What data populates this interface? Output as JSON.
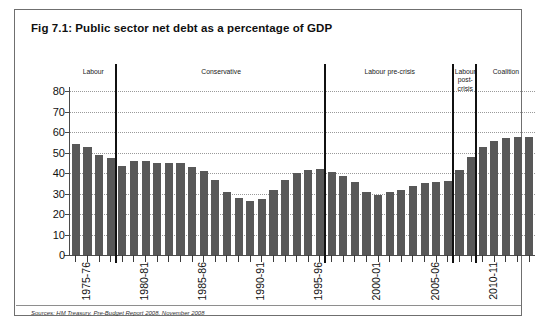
{
  "figure": {
    "title": "Fig 7.1: Public sector net debt as a percentage of GDP",
    "source": "Sources: HM Treasury, Pre-Budget Report 2008, November 2008",
    "border_color": "#6f6f6f",
    "bar_color": "#585858",
    "gridline_color": "#9a9a9a"
  },
  "periods": [
    {
      "label": "Labour",
      "start_index": 0,
      "end_index": 4
    },
    {
      "label": "Conservative",
      "start_index": 4,
      "end_index": 22
    },
    {
      "label": "Labour pre-crisis",
      "start_index": 22,
      "end_index": 33
    },
    {
      "label": "Labour post-crisis",
      "start_index": 33,
      "end_index": 35
    },
    {
      "label": "Coalition",
      "start_index": 35,
      "end_index": 40
    }
  ],
  "chart_data": {
    "type": "bar",
    "title": "Fig 7.1: Public sector net debt as a percentage of GDP",
    "xlabel": "",
    "ylabel": "",
    "ylim": [
      0,
      80
    ],
    "yticks": [
      0,
      10,
      20,
      30,
      40,
      50,
      60,
      70,
      80
    ],
    "grid": true,
    "legend": "none",
    "categories": [
      "1975-76",
      "1976-77",
      "1977-78",
      "1978-79",
      "1979-80",
      "1980-81",
      "1981-82",
      "1982-83",
      "1983-84",
      "1984-85",
      "1985-86",
      "1986-87",
      "1987-88",
      "1988-89",
      "1989-90",
      "1990-91",
      "1991-92",
      "1992-93",
      "1993-94",
      "1994-95",
      "1995-96",
      "1996-97",
      "1997-98",
      "1998-99",
      "1999-00",
      "2000-01",
      "2001-02",
      "2002-03",
      "2003-04",
      "2004-05",
      "2005-06",
      "2006-07",
      "2007-08",
      "2008-09",
      "2009-10",
      "2010-11",
      "2011-12",
      "2012-13",
      "2013-14",
      "2014-15"
    ],
    "tick_labels_shown": [
      "1975-76",
      "1980-81",
      "1985-86",
      "1990-91",
      "1995-96",
      "2000-01",
      "2005-06",
      "2010-11"
    ],
    "values": [
      54,
      52.5,
      49,
      47.5,
      43.5,
      46,
      46,
      45,
      45,
      45,
      43,
      41,
      36.5,
      30.5,
      28,
      26.5,
      27.5,
      31.5,
      36.5,
      40,
      41.5,
      42,
      40.5,
      38.5,
      35.5,
      30.5,
      29.5,
      30.5,
      31.5,
      33.5,
      35,
      35.5,
      36,
      41.5,
      48,
      52.5,
      55.5,
      57,
      57.5,
      57.5
    ]
  }
}
